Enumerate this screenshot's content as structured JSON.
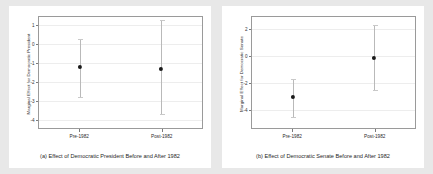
{
  "figure": {
    "background_color": "#e8e8e8",
    "panel_background_color": "#ffffff",
    "point_color": "#1a1a1a",
    "errorbar_color": "#b9b9b9"
  },
  "chart_data": [
    {
      "type": "scatter",
      "panel_id": "a",
      "title": "",
      "caption": "(a) Effect of Democratic President Before and After 1982",
      "xlabel": "",
      "ylabel": "Marginal Effect for Democratic President",
      "categories": [
        "Pre-1982",
        "Post-1982"
      ],
      "values": [
        -1.2,
        -1.3
      ],
      "ci_lower": [
        -2.8,
        -3.7
      ],
      "ci_upper": [
        0.3,
        1.3
      ],
      "yticks": [
        1,
        0,
        -1,
        -2,
        -3,
        -4
      ],
      "yticklabels": [
        "1",
        "0",
        "-1",
        "-2",
        "-3",
        "-4"
      ],
      "ylim": [
        -4.45,
        1.45
      ],
      "grid": true,
      "legend": "none"
    },
    {
      "type": "scatter",
      "panel_id": "b",
      "title": "",
      "caption": "(b) Effect of Democratic Senate Before and After 1982",
      "xlabel": "",
      "ylabel": "Marginal Effect for Democratic Senate",
      "categories": [
        "Pre-1982",
        "Post-1982"
      ],
      "values": [
        -3.0,
        -0.1
      ],
      "ci_lower": [
        -4.5,
        -2.5
      ],
      "ci_upper": [
        -1.7,
        2.3
      ],
      "yticks": [
        2,
        0,
        -2,
        -4
      ],
      "yticklabels": [
        "2",
        "0",
        "-2",
        "-4"
      ],
      "ylim": [
        -5.3,
        2.9
      ],
      "grid": true,
      "legend": "none"
    }
  ]
}
